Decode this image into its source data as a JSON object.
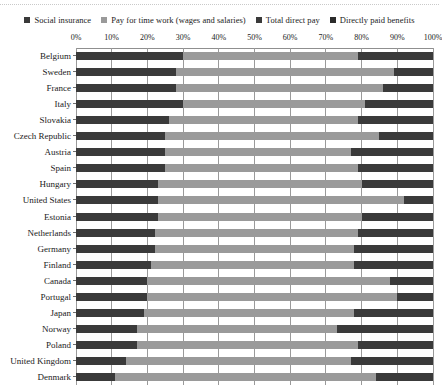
{
  "chart_data": {
    "type": "bar",
    "orientation": "horizontal",
    "stacked": true,
    "title": "",
    "xlabel": "",
    "ylabel": "",
    "xlim": [
      0,
      100
    ],
    "xticks": [
      "0%",
      "10%",
      "20%",
      "30%",
      "40%",
      "50%",
      "60%",
      "70%",
      "80%",
      "90%",
      "100%"
    ],
    "xtick_values": [
      0,
      10,
      20,
      30,
      40,
      50,
      60,
      70,
      80,
      90,
      100
    ],
    "grid": true,
    "legend_position": "top",
    "legend": [
      {
        "label": "Social insurance",
        "color": "#3a3a3a"
      },
      {
        "label": "Pay for time work (wages and salaries)",
        "color": "#9a9a9a"
      },
      {
        "label": "Total direct pay",
        "color": "#3a3a3a"
      },
      {
        "label": "Directly paid benefits",
        "color": "#2b2b2b"
      }
    ],
    "series": [
      {
        "name": "Social insurance",
        "color": "#3a3a3a",
        "values": [
          30,
          28,
          28,
          30,
          26,
          25,
          25,
          25,
          23,
          23,
          23,
          22,
          22,
          21,
          20,
          20,
          19,
          17,
          17,
          14,
          11
        ]
      },
      {
        "name": "Pay for time work (wages and salaries)",
        "color": "#9a9a9a",
        "values": [
          49,
          61,
          58,
          51,
          53,
          60,
          52,
          54,
          57,
          69,
          57,
          57,
          56,
          57,
          68,
          70,
          59,
          56,
          62,
          63,
          73
        ]
      },
      {
        "name": "Total direct pay",
        "color": "#3a3a3a",
        "values": [
          21,
          11,
          14,
          19,
          21,
          15,
          23,
          21,
          20,
          8,
          20,
          21,
          22,
          22,
          12,
          10,
          22,
          27,
          21,
          23,
          16
        ]
      }
    ],
    "categories": [
      "Belgium",
      "Sweden",
      "France",
      "Italy",
      "Slovakia",
      "Czech Republic",
      "Austria",
      "Spain",
      "Hungary",
      "United States",
      "Estonia",
      "Netherlands",
      "Germany",
      "Finland",
      "Canada",
      "Portugal",
      "Japan",
      "Norway",
      "Poland",
      "United Kingdom",
      "Denmark"
    ]
  }
}
